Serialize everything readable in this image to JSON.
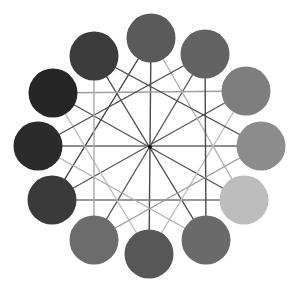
{
  "diagram": {
    "type": "circular-network",
    "center": [
      150,
      147
    ],
    "ring_radius": 110,
    "node_radius": 24.5,
    "nodes": [
      {
        "id": "n12",
        "position": "12 o'clock",
        "x": 151,
        "y": 38,
        "color": "#5a5a5a"
      },
      {
        "id": "n1",
        "position": "1 o'clock",
        "x": 205,
        "y": 54,
        "color": "#636363"
      },
      {
        "id": "n2",
        "position": "2 o'clock",
        "x": 246,
        "y": 91,
        "color": "#7e7e7e"
      },
      {
        "id": "n3",
        "position": "3 o'clock",
        "x": 261,
        "y": 146,
        "color": "#8c8c8c"
      },
      {
        "id": "n4",
        "position": "4 o'clock",
        "x": 244,
        "y": 200,
        "color": "#bdbdbd"
      },
      {
        "id": "n5",
        "position": "5 o'clock",
        "x": 206,
        "y": 240,
        "color": "#6a6a6a"
      },
      {
        "id": "n6",
        "position": "6 o'clock",
        "x": 149,
        "y": 254,
        "color": "#575757"
      },
      {
        "id": "n7",
        "position": "7 o'clock",
        "x": 94,
        "y": 240,
        "color": "#6c6c6c"
      },
      {
        "id": "n8",
        "position": "8 o'clock",
        "x": 52,
        "y": 200,
        "color": "#3a3a3a"
      },
      {
        "id": "n9",
        "position": "9 o'clock",
        "x": 38,
        "y": 146,
        "color": "#2b2b2b"
      },
      {
        "id": "n10",
        "position": "10 o'clock",
        "x": 53,
        "y": 93,
        "color": "#262626"
      },
      {
        "id": "n11",
        "position": "11 o'clock",
        "x": 94,
        "y": 56,
        "color": "#3c3c3c"
      }
    ],
    "edges": [
      {
        "from": 0,
        "to": 6,
        "color": "#4a4a4a"
      },
      {
        "from": 1,
        "to": 7,
        "color": "#5a5a5a"
      },
      {
        "from": 2,
        "to": 8,
        "color": "#5a5a5a"
      },
      {
        "from": 3,
        "to": 9,
        "color": "#6a6a6a"
      },
      {
        "from": 4,
        "to": 10,
        "color": "#555555"
      },
      {
        "from": 5,
        "to": 11,
        "color": "#4a4a4a"
      },
      {
        "from": 0,
        "to": 4,
        "color": "#b0b0b0"
      },
      {
        "from": 4,
        "to": 8,
        "color": "#777777"
      },
      {
        "from": 8,
        "to": 0,
        "color": "#3e3e3e"
      },
      {
        "from": 2,
        "to": 6,
        "color": "#bcbcbc"
      },
      {
        "from": 6,
        "to": 10,
        "color": "#bcbcbc"
      },
      {
        "from": 10,
        "to": 2,
        "color": "#a0a0a0"
      },
      {
        "from": 1,
        "to": 5,
        "color": "#4a4a4a"
      },
      {
        "from": 5,
        "to": 9,
        "color": "#b0b0b0"
      },
      {
        "from": 9,
        "to": 1,
        "color": "#505050"
      },
      {
        "from": 3,
        "to": 7,
        "color": "#9a9a9a"
      },
      {
        "from": 7,
        "to": 11,
        "color": "#a8a8a8"
      },
      {
        "from": 11,
        "to": 3,
        "color": "#4a4a4a"
      }
    ],
    "hub": {
      "x": 150,
      "y": 147,
      "color": "#111111"
    }
  }
}
